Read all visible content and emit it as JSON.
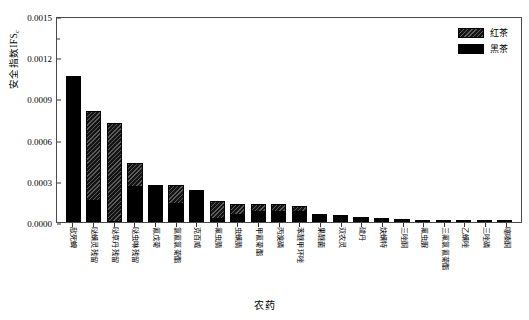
{
  "chart_data": {
    "type": "bar",
    "stacked": true,
    "title": "",
    "xlabel": "农药",
    "ylabel": "安全指数IFS",
    "ylabel_subscript": "c",
    "ylim": [
      0.0,
      0.0015
    ],
    "yticks": [
      "0.0000",
      "0.0003",
      "0.0006",
      "0.0009",
      "0.0012",
      "0.0015"
    ],
    "ytick_values": [
      0.0,
      0.0003,
      0.0006,
      0.0009,
      0.0012,
      0.0015
    ],
    "grid": false,
    "legend_position": "top-right",
    "categories": [
      "敌死蜱",
      "哒螨灵残留",
      "哒草丹残留",
      "哒虫啉残留",
      "氰戊菊",
      "氯氰氯菊酯",
      "克百威",
      "氟虫腈",
      "虫螨腈",
      "甲氰菊酯",
      "丙溴磷",
      "苯醚甲环唑",
      "果醚菌",
      "双农灵",
      "硫丹",
      "炔螨特",
      "三唑酮",
      "氟虫脲",
      "三氟氯氰菊酯",
      "乙螨唑",
      "三唑磷",
      "噻嗪酮"
    ],
    "series": [
      {
        "name": "红茶",
        "pattern": "hatched",
        "color": "#141414",
        "values": [
          0.0,
          0.00065,
          0.00072,
          0.000175,
          0.0,
          0.00014,
          0.0,
          0.00013,
          8e-05,
          6e-05,
          5.5e-05,
          4.5e-05,
          0.0,
          0.0,
          0.0,
          0.0,
          0.0,
          0.0,
          0.0,
          0.0,
          0.0,
          0.0
        ]
      },
      {
        "name": "黑茶",
        "pattern": "solid",
        "color": "#000000",
        "values": [
          0.00106,
          0.000155,
          0.0,
          0.000255,
          0.00027,
          0.00013,
          0.00023,
          2e-05,
          5e-05,
          7e-05,
          7.5e-05,
          7.5e-05,
          5.5e-05,
          4.8e-05,
          3.5e-05,
          2.8e-05,
          2.2e-05,
          1.8e-05,
          1.4e-05,
          1e-05,
          4e-06,
          2e-06
        ]
      }
    ],
    "totals": [
      0.00106,
      0.000805,
      0.00072,
      0.00043,
      0.00027,
      0.00027,
      0.00023,
      0.00015,
      0.00013,
      0.00013,
      0.00013,
      0.00012,
      0.00011,
      9.5e-05,
      6e-05,
      5e-05,
      4e-05,
      3.4e-05,
      2.8e-05,
      2.2e-05,
      1.2e-05,
      6e-06
    ]
  },
  "legend": {
    "entries": [
      {
        "label": "红茶"
      },
      {
        "label": "黑茶"
      }
    ]
  }
}
